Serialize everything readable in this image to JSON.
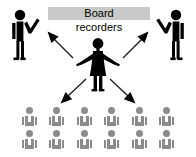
{
  "diagram": {
    "title_line1": "Board",
    "title_line2": "recorders",
    "colors": {
      "highlight_band": "#c9c9c9",
      "figure_primary": "#000000",
      "figure_audience": "#8c8c8c",
      "background": "#ffffff",
      "arrow": "#1a1a1a"
    },
    "actors": {
      "center": {
        "name": "central-speaker-figure",
        "description": "female figure with outstretched arms"
      },
      "left": {
        "name": "left-standing-figure",
        "description": "standing person with raised arm"
      },
      "right": {
        "name": "right-standing-figure",
        "description": "standing person with raised arm"
      }
    },
    "arrows": [
      {
        "name": "arrow-up-left",
        "direction": "up-left"
      },
      {
        "name": "arrow-up-right",
        "direction": "up-right"
      },
      {
        "name": "arrow-down-left",
        "direction": "down-left"
      },
      {
        "name": "arrow-down-right",
        "direction": "down-right"
      }
    ],
    "audience": {
      "rows": 2,
      "columns": 6,
      "total": 12,
      "grid": [
        [
          {
            "name": "audience-figure"
          },
          {
            "name": "audience-figure"
          },
          {
            "name": "audience-figure"
          },
          {
            "name": "audience-figure"
          },
          {
            "name": "audience-figure"
          },
          {
            "name": "audience-figure"
          }
        ],
        [
          {
            "name": "audience-figure"
          },
          {
            "name": "audience-figure"
          },
          {
            "name": "audience-figure"
          },
          {
            "name": "audience-figure"
          },
          {
            "name": "audience-figure"
          },
          {
            "name": "audience-figure"
          }
        ]
      ]
    }
  }
}
